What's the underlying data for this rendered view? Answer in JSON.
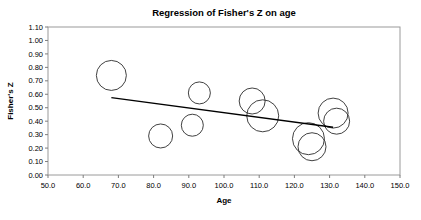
{
  "chart_data": {
    "type": "scatter",
    "title": "Regression of Fisher's Z on age",
    "xlabel": "Age",
    "ylabel": "Fisher's Z",
    "xlim": [
      50.0,
      150.0
    ],
    "ylim": [
      0.0,
      1.1
    ],
    "xticks": [
      "50.0",
      "60.0",
      "70.0",
      "80.0",
      "90.0",
      "100.0",
      "110.0",
      "120.0",
      "130.0",
      "140.0",
      "150.0"
    ],
    "xtick_values": [
      50,
      60,
      70,
      80,
      90,
      100,
      110,
      120,
      130,
      140,
      150
    ],
    "yticks": [
      "0.00",
      "0.10",
      "0.20",
      "0.30",
      "0.40",
      "0.50",
      "0.60",
      "0.70",
      "0.80",
      "0.90",
      "1.00",
      "1.10"
    ],
    "ytick_values": [
      0.0,
      0.1,
      0.2,
      0.3,
      0.4,
      0.5,
      0.6,
      0.7,
      0.8,
      0.9,
      1.0,
      1.1
    ],
    "grid": false,
    "legend": "none",
    "marker_style": "open-circle-bubble",
    "points": [
      {
        "x": 68.0,
        "y": 0.74,
        "r": 15
      },
      {
        "x": 82.0,
        "y": 0.29,
        "r": 12
      },
      {
        "x": 91.0,
        "y": 0.37,
        "r": 11
      },
      {
        "x": 93.0,
        "y": 0.61,
        "r": 11
      },
      {
        "x": 108.0,
        "y": 0.55,
        "r": 13
      },
      {
        "x": 111.0,
        "y": 0.44,
        "r": 16
      },
      {
        "x": 124.0,
        "y": 0.27,
        "r": 16
      },
      {
        "x": 125.0,
        "y": 0.21,
        "r": 14
      },
      {
        "x": 131.0,
        "y": 0.46,
        "r": 15
      },
      {
        "x": 132.0,
        "y": 0.4,
        "r": 13
      }
    ],
    "trendline": {
      "x_start": 68.0,
      "y_start": 0.575,
      "x_end": 131.0,
      "y_end": 0.355
    },
    "colors": {
      "bubble_stroke": "#2b2b2b",
      "trendline": "#000000",
      "frame": "#9a9a9a",
      "text": "#000000",
      "background": "#ffffff"
    }
  }
}
